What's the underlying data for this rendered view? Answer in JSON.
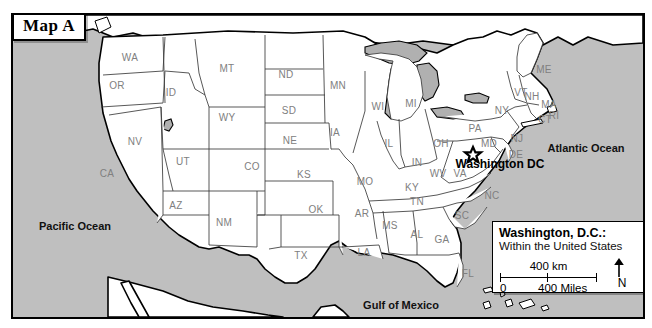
{
  "figure": {
    "tag_label": "Map A"
  },
  "colors": {
    "ocean": "#bfbfbf",
    "land": "#ffffff",
    "border": "#000000",
    "state_label": "#808080",
    "lake": "#b0b0b0"
  },
  "oceans": [
    {
      "name": "pacific-ocean",
      "label": "Pacific Ocean",
      "x": 62,
      "y": 211
    },
    {
      "name": "atlantic-ocean",
      "label": "Atlantic Ocean",
      "x": 573,
      "y": 133
    },
    {
      "name": "gulf-of-mexico",
      "label": "Gulf of Mexico",
      "x": 388,
      "y": 290
    }
  ],
  "capital": {
    "label": "Washington DC",
    "x": 487,
    "y": 149,
    "marker_x": 460,
    "marker_y": 140
  },
  "states": [
    {
      "code": "WA",
      "x": 117,
      "y": 42
    },
    {
      "code": "OR",
      "x": 104,
      "y": 70
    },
    {
      "code": "ID",
      "x": 158,
      "y": 77
    },
    {
      "code": "MT",
      "x": 214,
      "y": 53
    },
    {
      "code": "ND",
      "x": 273,
      "y": 59
    },
    {
      "code": "SD",
      "x": 276,
      "y": 95
    },
    {
      "code": "WY",
      "x": 214,
      "y": 102
    },
    {
      "code": "NV",
      "x": 122,
      "y": 126
    },
    {
      "code": "UT",
      "x": 170,
      "y": 146
    },
    {
      "code": "CA",
      "x": 94,
      "y": 158
    },
    {
      "code": "CO",
      "x": 239,
      "y": 151
    },
    {
      "code": "NE",
      "x": 277,
      "y": 125
    },
    {
      "code": "KS",
      "x": 291,
      "y": 159
    },
    {
      "code": "OK",
      "x": 303,
      "y": 194
    },
    {
      "code": "TX",
      "x": 288,
      "y": 240
    },
    {
      "code": "AZ",
      "x": 163,
      "y": 190
    },
    {
      "code": "NM",
      "x": 211,
      "y": 207
    },
    {
      "code": "MN",
      "x": 325,
      "y": 70
    },
    {
      "code": "IA",
      "x": 322,
      "y": 117
    },
    {
      "code": "MO",
      "x": 352,
      "y": 166
    },
    {
      "code": "AR",
      "x": 349,
      "y": 198
    },
    {
      "code": "LA",
      "x": 351,
      "y": 237
    },
    {
      "code": "MS",
      "x": 377,
      "y": 210
    },
    {
      "code": "AL",
      "x": 404,
      "y": 219
    },
    {
      "code": "GA",
      "x": 429,
      "y": 224
    },
    {
      "code": "FL",
      "x": 455,
      "y": 258
    },
    {
      "code": "SC",
      "x": 449,
      "y": 200
    },
    {
      "code": "NC",
      "x": 479,
      "y": 180
    },
    {
      "code": "TN",
      "x": 404,
      "y": 186
    },
    {
      "code": "KY",
      "x": 399,
      "y": 172
    },
    {
      "code": "VA",
      "x": 447,
      "y": 158
    },
    {
      "code": "WV",
      "x": 425,
      "y": 158
    },
    {
      "code": "MD",
      "x": 476,
      "y": 128
    },
    {
      "code": "DE",
      "x": 503,
      "y": 139
    },
    {
      "code": "NJ",
      "x": 504,
      "y": 123
    },
    {
      "code": "PA",
      "x": 462,
      "y": 113
    },
    {
      "code": "OH",
      "x": 428,
      "y": 128
    },
    {
      "code": "IN",
      "x": 404,
      "y": 147
    },
    {
      "code": "IL",
      "x": 376,
      "y": 128
    },
    {
      "code": "WI",
      "x": 365,
      "y": 91
    },
    {
      "code": "MI",
      "x": 398,
      "y": 88
    },
    {
      "code": "NY",
      "x": 489,
      "y": 95
    },
    {
      "code": "VT",
      "x": 508,
      "y": 77
    },
    {
      "code": "NH",
      "x": 519,
      "y": 81
    },
    {
      "code": "MA",
      "x": 536,
      "y": 89
    },
    {
      "code": "CT",
      "x": 532,
      "y": 104
    },
    {
      "code": "RI",
      "x": 541,
      "y": 100
    },
    {
      "code": "ME",
      "x": 531,
      "y": 54
    }
  ],
  "legend": {
    "title": "Washington, D.C.:",
    "subtitle": "Within the United States",
    "scale_km": "400 km",
    "scale_zero": "0",
    "scale_miles": "400 Miles",
    "north_label": "N",
    "north_arrow_icon": "north-arrow-icon"
  }
}
